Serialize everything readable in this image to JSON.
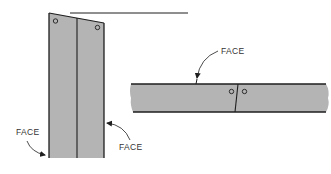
{
  "diagram": {
    "type": "lumber face orientation illustration",
    "colors": {
      "board_fill": "#b4b4b4",
      "outline": "#1e1e1e",
      "label": "#333333",
      "background": "#ffffff"
    },
    "vertical_assembly": {
      "description": "two boards joined edge-to-edge, standing vertically, each with a nail hole near the top",
      "labels": [
        {
          "id": "face-left",
          "text": "FACE"
        },
        {
          "id": "face-right",
          "text": "FACE"
        }
      ]
    },
    "horizontal_assembly": {
      "description": "board lying horizontally with a butt joint and two nail holes",
      "labels": [
        {
          "id": "face-top",
          "text": "FACE"
        }
      ]
    }
  }
}
